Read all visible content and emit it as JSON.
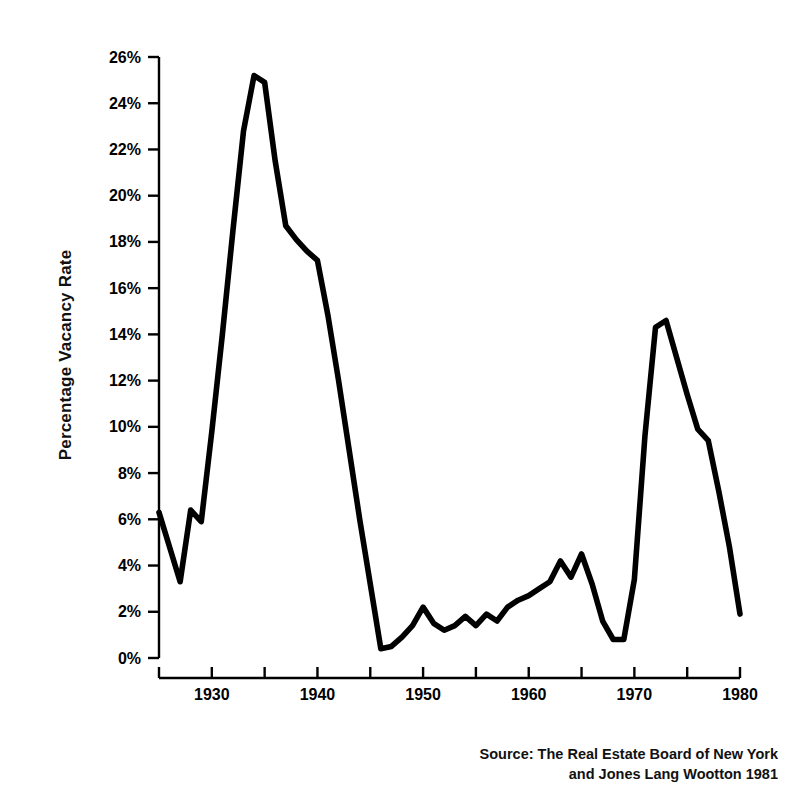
{
  "chart_data": {
    "type": "line",
    "title": "",
    "xlabel": "",
    "ylabel": "Percentage Vacancy Rate",
    "xlim": [
      1925,
      1980
    ],
    "ylim": [
      0,
      26
    ],
    "grid": false,
    "legend": null,
    "x_ticks": [
      1925,
      1930,
      1935,
      1940,
      1945,
      1950,
      1955,
      1960,
      1965,
      1970,
      1975,
      1980
    ],
    "x_tick_labels": [
      "",
      "1930",
      "",
      "1940",
      "",
      "1950",
      "",
      "1960",
      "",
      "1970",
      "",
      "1980"
    ],
    "y_ticks": [
      0,
      2,
      4,
      6,
      8,
      10,
      12,
      14,
      16,
      18,
      20,
      22,
      24,
      26
    ],
    "y_tick_labels": [
      "0%",
      "2%",
      "4%",
      "6%",
      "8%",
      "10%",
      "12%",
      "14%",
      "16%",
      "18%",
      "20%",
      "22%",
      "24%",
      "26%"
    ],
    "series": [
      {
        "name": "Percentage Vacancy Rate",
        "color": "#000000",
        "x": [
          1925,
          1926,
          1927,
          1928,
          1929,
          1930,
          1931,
          1932,
          1933,
          1934,
          1935,
          1936,
          1937,
          1938,
          1939,
          1940,
          1941,
          1942,
          1943,
          1944,
          1945,
          1946,
          1947,
          1948,
          1949,
          1950,
          1951,
          1952,
          1953,
          1954,
          1955,
          1956,
          1957,
          1958,
          1959,
          1960,
          1961,
          1962,
          1963,
          1964,
          1965,
          1966,
          1967,
          1968,
          1969,
          1970,
          1971,
          1972,
          1973,
          1974,
          1975,
          1976,
          1977,
          1978,
          1979,
          1980
        ],
        "y": [
          6.3,
          4.8,
          3.3,
          6.4,
          5.9,
          9.8,
          14.0,
          18.5,
          22.8,
          25.2,
          24.9,
          21.5,
          18.7,
          18.1,
          17.6,
          17.2,
          14.8,
          12.0,
          9.0,
          6.0,
          3.2,
          0.4,
          0.5,
          0.9,
          1.4,
          2.2,
          1.5,
          1.2,
          1.4,
          1.8,
          1.4,
          1.9,
          1.6,
          2.2,
          2.5,
          2.7,
          3.0,
          3.3,
          4.2,
          3.5,
          4.5,
          3.2,
          1.6,
          0.8,
          0.8,
          3.4,
          9.6,
          14.3,
          14.6,
          13.0,
          11.4,
          9.9,
          9.4,
          7.2,
          4.8,
          1.9
        ]
      }
    ],
    "annotations": {
      "source_line_1": "Source: The Real Estate Board of New York",
      "source_line_2": "and Jones Lang Wootton 1981"
    }
  },
  "axes": {
    "y_axis_title": "Percentage Vacancy Rate"
  },
  "source": {
    "line1": "Source: The Real Estate Board of New York",
    "line2": "and Jones Lang Wootton 1981"
  }
}
